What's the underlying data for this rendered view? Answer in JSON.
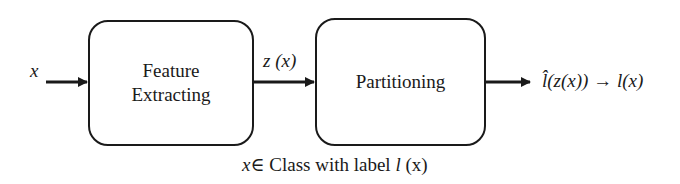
{
  "diagram": {
    "input_label": "x",
    "blocks": [
      {
        "id": "feature-extracting",
        "label_line1": "Feature",
        "label_line2": "Extracting"
      },
      {
        "id": "partitioning",
        "label": "Partitioning"
      }
    ],
    "edge_label_middle": "z (x)",
    "output_label": {
      "lhat": "l̂",
      "rest": "(z(x)) → ",
      "l": "l",
      "tail": "(x)"
    },
    "caption": {
      "prefix_italic": "x",
      "text": "∈ Class with label ",
      "label_italic": "l",
      "suffix": " (x)"
    }
  }
}
